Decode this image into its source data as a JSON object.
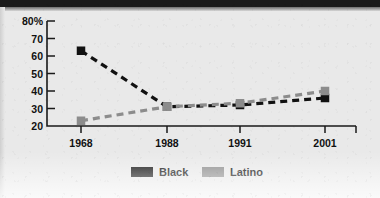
{
  "chart_data": {
    "type": "line",
    "title": "",
    "subtitle": "",
    "xlabel": "",
    "ylabel": "",
    "categories": [
      "1968",
      "1988",
      "1991",
      "2001"
    ],
    "series": [
      {
        "name": "Black",
        "color": "#111111",
        "values": [
          63,
          31,
          32,
          36
        ]
      },
      {
        "name": "Latino",
        "color": "#8c8c8c",
        "values": [
          23,
          31,
          33,
          40
        ]
      }
    ],
    "ylim": [
      20,
      80
    ],
    "y_ticks": [
      20,
      30,
      40,
      50,
      60,
      70,
      80
    ],
    "y_tick_labels": [
      "20",
      "30",
      "40",
      "50",
      "60",
      "70",
      "80%"
    ],
    "x_tick_labels": [
      "1968",
      "1988",
      "1991",
      "2001"
    ],
    "grid": false,
    "line_style": "dashed",
    "marker": "square",
    "legend_position": "bottom"
  },
  "axes": {
    "y": {
      "ticks": [
        {
          "label": "80%"
        },
        {
          "label": "70"
        },
        {
          "label": "60"
        },
        {
          "label": "50"
        },
        {
          "label": "40"
        },
        {
          "label": "30"
        },
        {
          "label": "20"
        }
      ]
    },
    "x": {
      "ticks": [
        {
          "label": "1968"
        },
        {
          "label": "1988"
        },
        {
          "label": "1991"
        },
        {
          "label": "2001"
        }
      ]
    }
  },
  "legend": {
    "items": [
      {
        "label": "Black",
        "color": "#111111"
      },
      {
        "label": "Latino",
        "color": "#8c8c8c"
      }
    ]
  },
  "colors": {
    "background": "#e9e9e9",
    "axis": "#1a1a1a",
    "black_series": "#111111",
    "latino_series": "#8c8c8c"
  }
}
